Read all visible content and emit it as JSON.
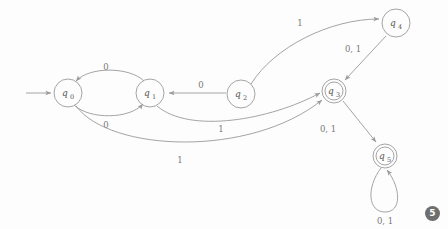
{
  "diagram": {
    "type": "finite-state-automaton",
    "title": "",
    "alphabet": [
      "0",
      "1"
    ],
    "start_state": "q0",
    "accepting_states": [
      "q3",
      "q5"
    ],
    "stroke_color": "#9a9a9a",
    "label_color": "#777777",
    "background_color": "#fdfdfd",
    "nodes": [
      {
        "id": "q0",
        "label": "q",
        "sub": "0",
        "x": 68,
        "y": 93,
        "r": 14,
        "accepting": false,
        "start": true
      },
      {
        "id": "q1",
        "label": "q",
        "sub": "1",
        "x": 150,
        "y": 93,
        "r": 14,
        "accepting": false,
        "start": false
      },
      {
        "id": "q2",
        "label": "q",
        "sub": "2",
        "x": 241,
        "y": 94,
        "r": 14,
        "accepting": false,
        "start": false
      },
      {
        "id": "q3",
        "label": "q",
        "sub": "3",
        "x": 334,
        "y": 91,
        "r": 12,
        "accepting": true,
        "start": false
      },
      {
        "id": "q4",
        "label": "q",
        "sub": "4",
        "x": 396,
        "y": 23,
        "r": 14,
        "accepting": false,
        "start": false
      },
      {
        "id": "q5",
        "label": "q",
        "sub": "5",
        "x": 385,
        "y": 156,
        "r": 12,
        "accepting": true,
        "start": false
      }
    ],
    "edges": [
      {
        "id": "start-arrow",
        "from": "",
        "to": "q0",
        "label": "",
        "label_x": 0,
        "label_y": 0
      },
      {
        "id": "q1-q0",
        "from": "q1",
        "to": "q0",
        "label": "0",
        "label_x": 106,
        "label_y": 70
      },
      {
        "id": "q0-q1",
        "from": "q0",
        "to": "q1",
        "label": "0",
        "label_x": 106,
        "label_y": 126
      },
      {
        "id": "q2-q1",
        "from": "q2",
        "to": "q1",
        "label": "0",
        "label_x": 201,
        "label_y": 88
      },
      {
        "id": "q2-q4",
        "from": "q2",
        "to": "q4",
        "label": "1",
        "label_x": 300,
        "label_y": 24
      },
      {
        "id": "q4-q3",
        "from": "q4",
        "to": "q3",
        "label": "0, 1",
        "label_x": 351,
        "label_y": 51
      },
      {
        "id": "q1-q3",
        "from": "q1",
        "to": "q3",
        "label": "1",
        "label_x": 221,
        "label_y": 130
      },
      {
        "id": "q0-q3",
        "from": "q0",
        "to": "q3",
        "label": "1",
        "label_x": 180,
        "label_y": 161
      },
      {
        "id": "q3-q5",
        "from": "q3",
        "to": "q5",
        "label": "0, 1",
        "label_x": 330,
        "label_y": 130
      },
      {
        "id": "q5-q5",
        "from": "q5",
        "to": "q5",
        "label": "0, 1",
        "label_x": 385,
        "label_y": 222
      }
    ]
  },
  "badge": {
    "text": "5"
  }
}
